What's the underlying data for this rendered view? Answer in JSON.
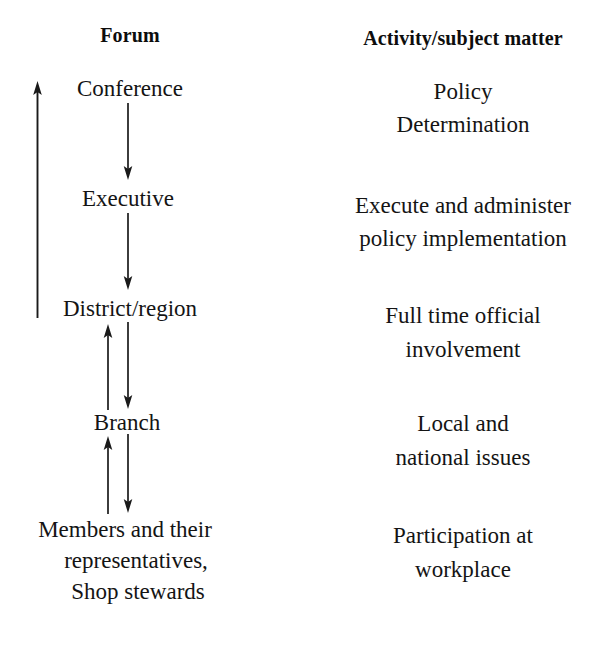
{
  "page": {
    "background_color": "#ffffff",
    "text_color": "#141414"
  },
  "headers": {
    "left": "Forum",
    "right": "Activity/subject matter"
  },
  "forum_nodes": [
    {
      "id": "conference",
      "label": "Conference"
    },
    {
      "id": "executive",
      "label": "Executive"
    },
    {
      "id": "district-region",
      "label": "District/region"
    },
    {
      "id": "branch",
      "label": "Branch"
    },
    {
      "id": "members",
      "line1": "Members and their",
      "line2": "representatives,",
      "line3": "Shop stewards"
    }
  ],
  "activities": [
    {
      "id": "policy-determination",
      "line1": "Policy",
      "line2": "Determination"
    },
    {
      "id": "execute-administer",
      "line1": "Execute and administer",
      "line2": "policy implementation"
    },
    {
      "id": "full-time-official",
      "line1": "Full time official",
      "line2": "involvement"
    },
    {
      "id": "local-national",
      "line1": "Local and",
      "line2": "national issues"
    },
    {
      "id": "participation",
      "line1": "Participation at",
      "line2": "workplace"
    }
  ],
  "connectors": [
    {
      "id": "feedback-spine",
      "direction": "up",
      "from": "members-and-their-representatives",
      "to": "conference"
    },
    {
      "id": "conference-to-executive",
      "direction": "down",
      "from": "conference",
      "to": "executive"
    },
    {
      "id": "executive-to-district",
      "direction": "down",
      "from": "executive",
      "to": "district-region"
    },
    {
      "id": "district-to-branch-up",
      "direction": "up",
      "from": "branch",
      "to": "district-region"
    },
    {
      "id": "district-to-branch-down",
      "direction": "down",
      "from": "district-region",
      "to": "branch"
    },
    {
      "id": "branch-to-members-up",
      "direction": "up",
      "from": "members",
      "to": "branch"
    },
    {
      "id": "branch-to-members-down",
      "direction": "down",
      "from": "branch",
      "to": "members"
    }
  ]
}
